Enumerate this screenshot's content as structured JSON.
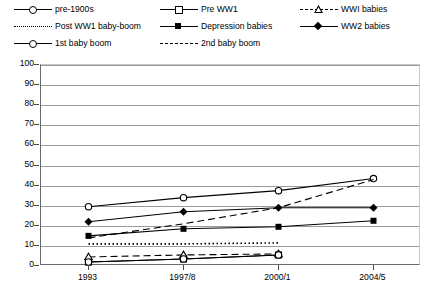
{
  "chart_data": {
    "type": "line",
    "title": "",
    "xlabel": "",
    "ylabel": "",
    "categories": [
      "1993",
      "1997/8",
      "2000/1",
      "2004/5"
    ],
    "ylim": [
      0,
      100
    ],
    "ytick_step": 10,
    "yticks": [
      "0",
      "10",
      "20",
      "30",
      "40",
      "50",
      "60",
      "70",
      "80",
      "90",
      "100"
    ],
    "grid": true,
    "legend_position": "top",
    "series": [
      {
        "name": "pre-1900s",
        "marker": "open-circle",
        "line": "solid",
        "values": [
          29.5,
          34,
          37.5,
          43.5
        ]
      },
      {
        "name": "Pre WW1",
        "marker": "open-square",
        "line": "solid",
        "values": [
          2,
          3.5,
          5.5,
          null
        ]
      },
      {
        "name": "WWI babies",
        "marker": "open-triangle",
        "line": "dashed",
        "values": [
          4.5,
          5.5,
          6,
          null
        ]
      },
      {
        "name": "Post WW1 baby-boom",
        "marker": "none",
        "line": "dotted",
        "values": [
          11,
          11,
          11.5,
          null
        ]
      },
      {
        "name": "Depression babies",
        "marker": "filled-square",
        "line": "solid",
        "values": [
          15,
          18.5,
          19.5,
          22.5
        ]
      },
      {
        "name": "WW2 babies",
        "marker": "filled-diamond",
        "line": "solid",
        "values": [
          22,
          27,
          29,
          29
        ]
      },
      {
        "name": "1st baby boom",
        "marker": "open-circle",
        "line": "solid",
        "values": [
          2,
          3.5,
          5.5,
          null
        ]
      },
      {
        "name": "2nd baby boom",
        "marker": "none",
        "line": "dashed",
        "values": [
          14,
          21,
          29,
          43
        ]
      }
    ]
  },
  "legend": {
    "items": [
      {
        "label": "pre-1900s"
      },
      {
        "label": "Pre WW1"
      },
      {
        "label": "WWI babies"
      },
      {
        "label": "Post WW1 baby-boom"
      },
      {
        "label": "Depression babies"
      },
      {
        "label": "WW2 babies"
      },
      {
        "label": "1st baby boom"
      },
      {
        "label": "2nd baby boom"
      }
    ]
  },
  "colors": {
    "ink": "#000000",
    "grid": "#9a9a9a",
    "axis": "#6b6b6b"
  }
}
